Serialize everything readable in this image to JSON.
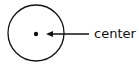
{
  "diagram": {
    "shape": "circle",
    "marker": "center-point",
    "annotation": {
      "label": "center",
      "arrow_direction": "left"
    },
    "colors": {
      "stroke": "#111111",
      "background": "#ffffff"
    }
  }
}
